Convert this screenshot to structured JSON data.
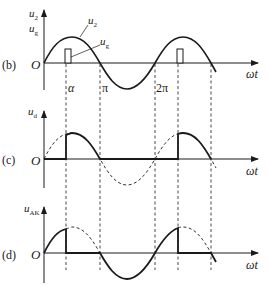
{
  "figure": {
    "panels": [
      {
        "id": "b",
        "label": "(b)",
        "y_label": "u",
        "y_label_sub": "2",
        "y_label2": "u",
        "y_label2_sub": "g",
        "origin": "O",
        "x_label": "ωt",
        "curve_labels": [
          {
            "text": "u",
            "sub": "2"
          },
          {
            "text": "u",
            "sub": "g"
          }
        ],
        "tick_labels": [
          "α",
          "π",
          "2π"
        ]
      },
      {
        "id": "c",
        "label": "(c)",
        "y_label": "u",
        "y_label_sub": "d",
        "origin": "O",
        "x_label": "ωt"
      },
      {
        "id": "d",
        "label": "(d)",
        "y_label": "u",
        "y_label_sub": "AK",
        "origin": "O",
        "x_label": "ωt"
      }
    ]
  },
  "colors": {
    "stroke": "#1a1a1a",
    "background": "#ffffff"
  }
}
